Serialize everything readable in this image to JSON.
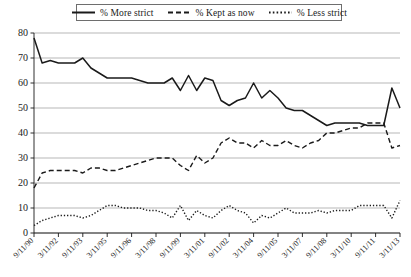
{
  "chart_data": {
    "type": "line",
    "title": "",
    "xlabel": "",
    "ylabel": "",
    "ylim": [
      0,
      80
    ],
    "ytick_step": 10,
    "grid": "horizontal",
    "legend_position": "top-center",
    "yticks": [
      0,
      10,
      20,
      30,
      40,
      50,
      60,
      70,
      80
    ],
    "x": [
      "9/11/90",
      "3/11/91",
      "9/11/91",
      "3/11/92",
      "9/11/92",
      "3/11/93",
      "9/11/93",
      "3/11/94",
      "9/11/94",
      "3/11/95",
      "9/11/95",
      "3/11/96",
      "9/11/96",
      "3/11/97",
      "9/11/97",
      "3/11/98",
      "9/11/98",
      "3/11/99",
      "9/11/99",
      "3/11/00",
      "9/11/00",
      "3/11/01",
      "9/11/01",
      "3/11/02",
      "9/11/02",
      "3/11/03",
      "9/11/03",
      "3/11/04",
      "9/11/04",
      "3/11/05",
      "9/11/05",
      "3/11/06",
      "9/11/06",
      "3/11/07",
      "9/11/07",
      "3/11/08",
      "9/11/08",
      "3/11/09",
      "9/11/09",
      "3/11/10",
      "9/11/10",
      "3/11/11",
      "9/11/11",
      "3/11/12",
      "9/11/12",
      "3/11/13"
    ],
    "xtick_labels": [
      "9/11/90",
      "3/11/92",
      "9/11/93",
      "3/11/95",
      "9/11/96",
      "3/11/98",
      "9/11/99",
      "3/11/01",
      "9/11/02",
      "3/11/04",
      "9/11/05",
      "3/11/07",
      "9/11/08",
      "3/11/10",
      "9/11/11",
      "3/11/13"
    ],
    "xtick_label_indices": [
      0,
      3,
      6,
      9,
      12,
      15,
      18,
      21,
      24,
      27,
      30,
      33,
      36,
      39,
      42,
      45
    ],
    "series": [
      {
        "name": "% More strict",
        "style": "solid",
        "color": "#1a1a1a",
        "values": [
          78,
          68,
          69,
          68,
          68,
          68,
          70,
          66,
          64,
          62,
          62,
          62,
          62,
          61,
          60,
          60,
          60,
          62,
          57,
          63,
          57,
          62,
          61,
          53,
          51,
          53,
          54,
          60,
          54,
          57,
          54,
          50,
          49,
          49,
          47,
          45,
          43,
          44,
          44,
          44,
          44,
          43,
          43,
          43,
          58,
          50
        ]
      },
      {
        "name": "% Kept as now",
        "style": "dashed",
        "color": "#1a1a1a",
        "values": [
          18,
          24,
          25,
          25,
          25,
          25,
          24,
          26,
          26,
          25,
          25,
          26,
          27,
          28,
          29,
          30,
          30,
          30,
          27,
          25,
          31,
          28,
          30,
          36,
          38,
          36,
          36,
          34,
          37,
          35,
          35,
          37,
          35,
          34,
          36,
          37,
          40,
          40,
          41,
          42,
          42,
          44,
          44,
          44,
          34,
          35
        ]
      },
      {
        "name": "% Less strict",
        "style": "dotted",
        "color": "#1a1a1a",
        "values": [
          3,
          5,
          6,
          7,
          7,
          7,
          6,
          7,
          9,
          11,
          11,
          10,
          10,
          10,
          9,
          9,
          8,
          6,
          11,
          5,
          9,
          7,
          6,
          9,
          11,
          9,
          8,
          4,
          7,
          6,
          8,
          10,
          8,
          8,
          8,
          9,
          8,
          9,
          9,
          9,
          11,
          11,
          11,
          11,
          6,
          13
        ]
      }
    ],
    "legend": [
      {
        "label": "% More strict",
        "style": "solid"
      },
      {
        "label": "% Kept as now",
        "style": "dashed"
      },
      {
        "label": "% Less strict",
        "style": "dotted"
      }
    ]
  }
}
